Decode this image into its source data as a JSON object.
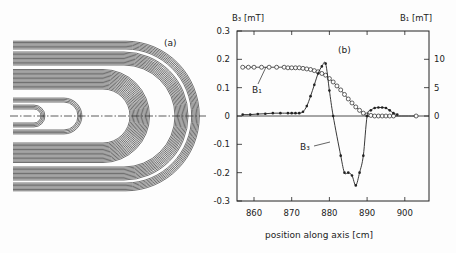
{
  "panel_a": {
    "label": "(a)"
  },
  "panel_b": {
    "label": "(b)",
    "left_axis_label": "B₃ [mT]",
    "right_axis_label": "B₁ [mT]",
    "xlabel": "position along axis [cm]",
    "curve_labels": {
      "b1": "B₁",
      "b3": "B₃"
    }
  },
  "chart_data": {
    "type": "line",
    "title": "",
    "panel": "(b)",
    "xlabel": "position along axis [cm]",
    "ylabel_left": "B3 [mT]",
    "ylabel_right": "B1 [mT]",
    "xlim": [
      855.5,
      906.5
    ],
    "ylim_left": [
      -0.3,
      0.3
    ],
    "ylim_right": [
      -15,
      15
    ],
    "x_ticks": [
      860,
      870,
      880,
      890,
      900
    ],
    "y_ticks_left": [
      -0.3,
      -0.2,
      -0.1,
      0,
      0.1,
      0.2,
      0.3
    ],
    "y_ticks_right": [
      0,
      5,
      10
    ],
    "grid": false,
    "zero_line": true,
    "series": [
      {
        "name": "B1",
        "axis": "right",
        "marker": "open-circle",
        "x": [
          857,
          858.5,
          860,
          862,
          864,
          866,
          868,
          869,
          870,
          871,
          872,
          873,
          874,
          875,
          876,
          877,
          878,
          879,
          880,
          881,
          882,
          883,
          884,
          885,
          886,
          887,
          888,
          889,
          890,
          891,
          892,
          893,
          894,
          895,
          896,
          897,
          903
        ],
        "values": [
          8.6,
          8.6,
          8.6,
          8.6,
          8.6,
          8.6,
          8.6,
          8.5,
          8.5,
          8.5,
          8.5,
          8.4,
          8.3,
          8.2,
          8.0,
          7.8,
          7.5,
          7.2,
          6.6,
          6.0,
          5.3,
          4.6,
          3.8,
          3.0,
          2.3,
          1.6,
          1.0,
          0.5,
          0.2,
          0.1,
          0.0,
          0.0,
          0.0,
          0.0,
          0.0,
          0.0,
          0.0
        ]
      },
      {
        "name": "B3",
        "axis": "left",
        "marker": "filled-dot",
        "x": [
          857,
          859,
          861,
          863,
          865,
          867,
          869,
          870,
          871,
          872,
          873,
          874,
          875,
          876,
          877,
          878,
          879,
          880,
          881,
          883,
          884,
          885,
          886,
          887,
          888,
          889,
          890,
          891,
          892,
          893,
          894,
          895,
          896,
          897,
          898
        ],
        "values": [
          0.005,
          0.005,
          0.007,
          0.008,
          0.01,
          0.01,
          0.01,
          0.01,
          0.01,
          0.01,
          0.015,
          0.035,
          0.07,
          0.11,
          0.15,
          0.175,
          0.185,
          0.09,
          0.0,
          -0.14,
          -0.2,
          -0.2,
          -0.21,
          -0.245,
          -0.2,
          -0.14,
          0.0,
          0.02,
          0.028,
          0.03,
          0.03,
          0.028,
          0.02,
          0.01,
          0.005
        ]
      }
    ]
  }
}
